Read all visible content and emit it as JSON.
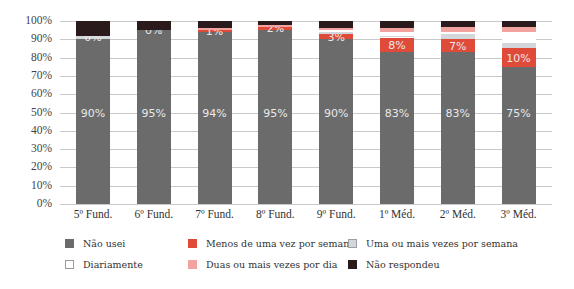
{
  "chart_data": {
    "type": "bar",
    "stacked": true,
    "title": "",
    "xlabel": "",
    "ylabel": "",
    "ylim": [
      0,
      100
    ],
    "y_ticks": [
      "0%",
      "10%",
      "20%",
      "30%",
      "40%",
      "50%",
      "60%",
      "70%",
      "80%",
      "90%",
      "100%"
    ],
    "grid": true,
    "legend_position": "bottom",
    "categories": [
      "5º Fund.",
      "6º Fund.",
      "7º Fund.",
      "8º Fund.",
      "9º Fund.",
      "1º Méd.",
      "2º Méd.",
      "3º Méd."
    ],
    "series": [
      {
        "name": "Não usei",
        "color": "#6b6b6b",
        "values": [
          90,
          95,
          94,
          95,
          90,
          83,
          83,
          75
        ],
        "labels": [
          "90%",
          "95%",
          "94%",
          "95%",
          "90%",
          "83%",
          "83%",
          "75%"
        ]
      },
      {
        "name": "Menos de uma vez por semana",
        "color": "#e04a38",
        "values": [
          0,
          0,
          1,
          2,
          3,
          8,
          7,
          10
        ],
        "labels": [
          "",
          "",
          "1%",
          "2%",
          "3%",
          "8%",
          "7%",
          "10%"
        ]
      },
      {
        "name": "Uma ou mais vezes por semana",
        "color": "#d3d6da",
        "values": [
          2,
          0,
          0,
          0,
          1,
          1,
          3,
          3
        ],
        "labels": [
          "0%",
          "0%",
          "",
          "",
          "",
          "",
          "",
          ""
        ]
      },
      {
        "name": "Diariamente",
        "color": "#ffffff",
        "values": [
          0,
          0,
          0,
          0,
          1,
          2,
          1,
          6
        ],
        "labels": [
          "",
          "",
          "",
          "",
          "",
          "",
          "",
          ""
        ]
      },
      {
        "name": "Duas ou mais vezes por dia",
        "color": "#f2a3a0",
        "values": [
          0,
          0,
          1,
          1,
          1,
          2,
          3,
          3
        ],
        "labels": [
          "",
          "",
          "",
          "",
          "",
          "",
          "",
          ""
        ]
      },
      {
        "name": "Não respondeu",
        "color": "#2a1a1c",
        "values": [
          8,
          5,
          4,
          2,
          4,
          4,
          3,
          3
        ],
        "labels": [
          "",
          "",
          "",
          "",
          "",
          "",
          "",
          ""
        ]
      }
    ]
  },
  "legend": [
    {
      "label": "Não usei",
      "color": "#6b6b6b"
    },
    {
      "label": "Menos de uma vez por semana",
      "color": "#e04a38"
    },
    {
      "label": "Uma ou mais vezes por semana",
      "color": "#d3d6da"
    },
    {
      "label": "Diariamente",
      "color": "#ffffff"
    },
    {
      "label": "Duas ou mais vezes por dia",
      "color": "#f2a3a0"
    },
    {
      "label": "Não respondeu",
      "color": "#2a1a1c"
    }
  ]
}
